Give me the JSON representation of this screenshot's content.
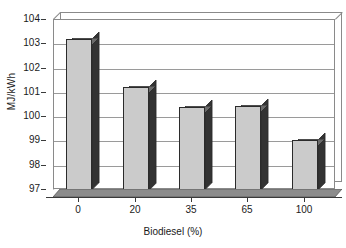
{
  "chart_data": {
    "type": "bar",
    "title": "",
    "subtitle": "",
    "xlabel": "Biodiesel (%)",
    "ylabel": "MJ/kWh",
    "categories": [
      "0",
      "20",
      "35",
      "65",
      "100"
    ],
    "values": [
      103.2,
      101.25,
      100.4,
      100.45,
      99.05
    ],
    "ylim": [
      97,
      104
    ],
    "ytick_labels": [
      "104",
      "103",
      "102",
      "101",
      "100",
      "99",
      "98",
      "97"
    ],
    "ytick_values": [
      104,
      103,
      102,
      101,
      100,
      99,
      98,
      97
    ],
    "ystep": 1,
    "grid": true,
    "grid_axis": "y",
    "legend": "none",
    "style": "3d-column",
    "colors": {
      "bar_front": "#cbcbcb",
      "bar_side": "#333333",
      "bar_top": "#6a6a6a",
      "bar_outline": "#2b2b2b",
      "gridline": "#9a9a9a",
      "plot_border": "#8a8a8a",
      "plot_background": "#ffffff",
      "axis": "#3a3a3a",
      "text": "#1a1a1a"
    },
    "series": [
      {
        "name": "Energy consumption",
        "values": [
          103.2,
          101.25,
          100.4,
          100.45,
          99.05
        ]
      }
    ],
    "points": [
      {
        "category": "0",
        "value": 103.2
      },
      {
        "category": "20",
        "value": 101.25
      },
      {
        "category": "35",
        "value": 100.4
      },
      {
        "category": "65",
        "value": 100.45
      },
      {
        "category": "100",
        "value": 99.05
      }
    ]
  }
}
